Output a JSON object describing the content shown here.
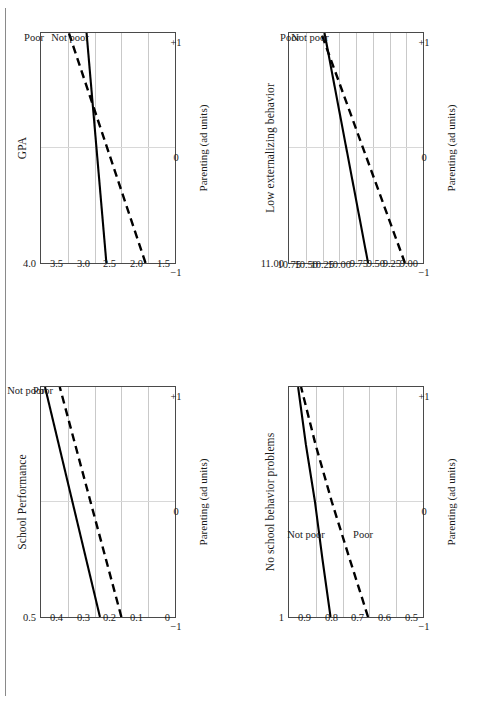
{
  "figure": {
    "rule_color": "#8a8a8a",
    "panel_count": 4,
    "line_color": "#000000"
  },
  "chart_data": [
    {
      "id": "gpa",
      "type": "line",
      "title": "GPA",
      "xlabel": "Parenting (ad units)",
      "ylabel": "",
      "xlim": [
        -1,
        1
      ],
      "ylim": [
        1.5,
        4.0
      ],
      "xticks": [
        "−1",
        "0",
        "+1"
      ],
      "xtick_values": [
        -1,
        0,
        1
      ],
      "yticks": [
        "1.5",
        "2.0",
        "2.5",
        "3.0",
        "3.5",
        "4.0"
      ],
      "ytick_values": [
        1.5,
        2.0,
        2.5,
        3.0,
        3.5,
        4.0
      ],
      "grid": true,
      "legend_position": "top-right-inline",
      "series": [
        {
          "name": "Not poor",
          "style": "solid",
          "x": [
            -1,
            1
          ],
          "values": [
            2.78,
            3.15
          ]
        },
        {
          "name": "Poor",
          "style": "dashed",
          "x": [
            -1,
            1
          ],
          "values": [
            2.05,
            3.48
          ]
        }
      ]
    },
    {
      "id": "externalizing",
      "type": "line",
      "title": "Low externalizing behavior",
      "xlabel": "Parenting (ad units)",
      "ylabel": "",
      "xlim": [
        -1,
        1
      ],
      "ylim": [
        9.0,
        11.0
      ],
      "xticks": [
        "−1",
        "0",
        "+1"
      ],
      "xtick_values": [
        -1,
        0,
        1
      ],
      "yticks": [
        "9.00",
        "9.25",
        "9.50",
        "9.75",
        "10.00",
        "10.25",
        "10.50",
        "10.75",
        "11.00"
      ],
      "ytick_values": [
        9.0,
        9.25,
        9.5,
        9.75,
        10.0,
        10.25,
        10.5,
        10.75,
        11.0
      ],
      "grid": true,
      "legend_position": "top-right-inline",
      "series": [
        {
          "name": "Not poor",
          "style": "solid",
          "x": [
            -1,
            1
          ],
          "values": [
            9.82,
            10.47
          ]
        },
        {
          "name": "Poor",
          "style": "dashed",
          "x": [
            -1,
            1
          ],
          "values": [
            9.27,
            10.52
          ]
        }
      ]
    },
    {
      "id": "school-performance",
      "type": "line",
      "title": "School Performance",
      "xlabel": "Parenting (ad units)",
      "ylabel": "",
      "xlim": [
        -1,
        1
      ],
      "ylim": [
        0,
        0.5
      ],
      "xticks": [
        "−1",
        "0",
        "+1"
      ],
      "xtick_values": [
        -1,
        0,
        1
      ],
      "yticks": [
        "0",
        "0.1",
        "0.2",
        "0.3",
        "0.4",
        "0.5"
      ],
      "ytick_values": [
        0,
        0.1,
        0.2,
        0.3,
        0.4,
        0.5
      ],
      "grid": true,
      "legend_position": "top-right-inline",
      "series": [
        {
          "name": "Not poor",
          "style": "solid",
          "x": [
            -1,
            1
          ],
          "values": [
            0.28,
            0.485
          ]
        },
        {
          "name": "Poor",
          "style": "dashed",
          "x": [
            -1,
            1
          ],
          "values": [
            0.2,
            0.43
          ]
        }
      ]
    },
    {
      "id": "behavior-problems",
      "type": "line",
      "title": "No school behavior problems",
      "xlabel": "Parenting (ad units)",
      "ylabel": "",
      "xlim": [
        -1,
        1
      ],
      "ylim": [
        0.5,
        1.0
      ],
      "xticks": [
        "−1",
        "0",
        "+1"
      ],
      "xtick_values": [
        -1,
        0,
        1
      ],
      "yticks": [
        "0.5",
        "0.6",
        "0.7",
        "0.8",
        "0.9",
        "1"
      ],
      "ytick_values": [
        0.5,
        0.6,
        0.7,
        0.8,
        0.9,
        1.0
      ],
      "grid": true,
      "legend_position": "mid-right-inline",
      "series": [
        {
          "name": "Not poor",
          "style": "solid",
          "x": [
            -1,
            -0.5,
            0,
            0.5,
            1
          ],
          "values": [
            0.845,
            0.875,
            0.903,
            0.937,
            0.966
          ]
        },
        {
          "name": "Poor",
          "style": "dashed",
          "x": [
            -1,
            -0.5,
            0,
            0.5,
            1
          ],
          "values": [
            0.705,
            0.773,
            0.84,
            0.901,
            0.955
          ]
        }
      ]
    }
  ]
}
